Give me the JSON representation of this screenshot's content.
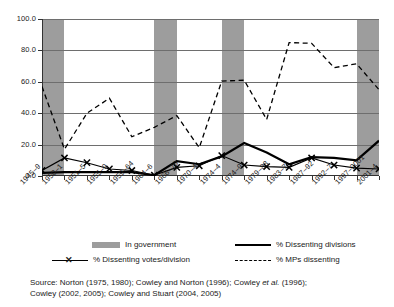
{
  "chart_data": {
    "type": "line",
    "title": "",
    "subtitle": "",
    "xlabel": "",
    "ylabel": "",
    "ylim": [
      0.0,
      100.0
    ],
    "ytick_values": [
      0.0,
      20.0,
      40.0,
      60.0,
      80.0,
      100.0
    ],
    "ytick_labels": [
      "0.0",
      "20.0",
      "40.0",
      "60.0",
      "80.0",
      "100.0"
    ],
    "grid": true,
    "legend_position": "below-plot",
    "categories": [
      "1945–9",
      "1950–1",
      "1951–5",
      "1955–9",
      "1959–64",
      "1964–6",
      "1966–70",
      "1970–4",
      "1974–4",
      "1974–9",
      "1979–83",
      "1983–7",
      "1987–92",
      "1992–7",
      "1997–2001",
      "2001–4"
    ],
    "series": [
      {
        "name": "% MPs dissenting",
        "style": "dashed",
        "color": "#000000",
        "values": [
          57.0,
          17.0,
          40.0,
          49.5,
          25.0,
          31.0,
          38.5,
          18.0,
          60.5,
          61.0,
          36.0,
          85.0,
          84.5,
          69.0,
          71.5,
          55.0
        ]
      },
      {
        "name": "% Dissenting divisions",
        "style": "solid",
        "color": "#000000",
        "values": [
          2.0,
          2.5,
          2.5,
          2.5,
          2.5,
          0.5,
          9.5,
          7.5,
          12.5,
          21.0,
          15.0,
          7.5,
          12.0,
          11.5,
          10.0,
          22.5
        ]
      },
      {
        "name": "% Dissenting votes/division",
        "style": "solid-x",
        "color": "#000000",
        "values": [
          3.5,
          11.5,
          8.5,
          4.5,
          3.5,
          0.5,
          5.5,
          6.5,
          13.0,
          7.0,
          6.0,
          5.5,
          11.5,
          7.0,
          5.0,
          4.5
        ]
      }
    ],
    "bands": {
      "name": "In government",
      "color": "#9d9d9d",
      "spans": [
        {
          "from": "1945–9",
          "to": "1950–1"
        },
        {
          "from": "1964–6",
          "to": "1966–70"
        },
        {
          "from": "1974–4",
          "to": "1974–9"
        },
        {
          "from": "1997–2001",
          "to": "2001–4"
        }
      ]
    }
  },
  "legend": {
    "items": [
      {
        "key": "in-government",
        "label": "In government",
        "marker": "band"
      },
      {
        "key": "dissenting-divisions",
        "label": "% Dissenting divisions",
        "marker": "solid"
      },
      {
        "key": "dissenting-votes-division",
        "label": "% Dissenting votes/division",
        "marker": "solid-x"
      },
      {
        "key": "mps-dissenting",
        "label": "% MPs dissenting",
        "marker": "dashed"
      }
    ]
  },
  "source": {
    "prefix": "Source:",
    "line1_a": " Norton (1975, 1980); Cowley and Norton (1996); Cowley ",
    "line1_italic": "et al.",
    "line1_b": " (1996);",
    "line2": "Cowley (2002, 2005); Cowley and Stuart (2004, 2005)"
  }
}
